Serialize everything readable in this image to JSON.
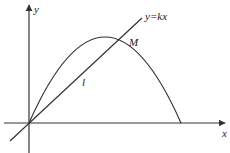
{
  "diagram": {
    "axes": {
      "x_label": "x",
      "y_label": "y",
      "origin": [
        29,
        123
      ]
    },
    "labels": {
      "line": "y=kx",
      "point": "M",
      "segment": "l"
    },
    "colors": {
      "stroke": "#333333",
      "background": "#ffffff"
    },
    "curve": {
      "type": "parabola",
      "start": [
        29,
        123
      ],
      "vertex": [
        105,
        37
      ],
      "end": [
        181,
        123
      ]
    },
    "line": {
      "from": [
        10,
        141
      ],
      "to": [
        142,
        18
      ]
    }
  }
}
